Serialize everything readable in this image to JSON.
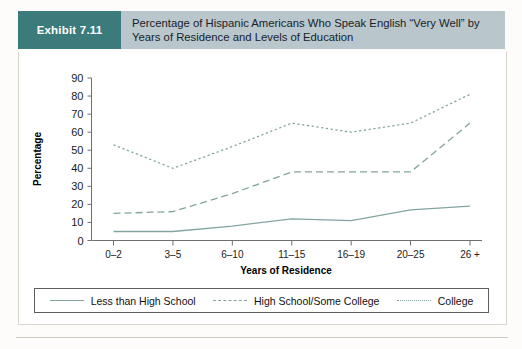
{
  "header": {
    "exhibit_label": "Exhibit 7.11",
    "title": "Percentage of Hispanic Americans Who Speak English “Very Well” by Years of Residence and Levels of Education"
  },
  "colors": {
    "tag_background": "#3c7b7b",
    "header_background": "#b9c6cb",
    "line": "#83a5a1",
    "axis": "#6f6f6f"
  },
  "chart_data": {
    "type": "line",
    "title": "Percentage of Hispanic Americans Who Speak English “Very Well” by Years of Residence and Levels of Education",
    "xlabel": "Years of Residence",
    "ylabel": "Percentage",
    "categories": [
      "0–2",
      "3–5",
      "6–10",
      "11–15",
      "16–19",
      "20–25",
      "26 +"
    ],
    "yticks": [
      0,
      10,
      20,
      30,
      40,
      50,
      60,
      70,
      80,
      90
    ],
    "ylim": [
      0,
      90
    ],
    "grid": false,
    "legend_position": "bottom",
    "series": [
      {
        "name": "Less than High School",
        "style": "solid",
        "values": [
          5,
          5,
          8,
          12,
          11,
          17,
          19
        ]
      },
      {
        "name": "High School/Some College",
        "style": "dashed",
        "values": [
          15,
          16,
          26,
          38,
          38,
          38,
          65
        ]
      },
      {
        "name": "College",
        "style": "dotted",
        "values": [
          53,
          40,
          52,
          65,
          60,
          65,
          81
        ]
      }
    ]
  },
  "legend": {
    "items": [
      {
        "label": "Less than High School",
        "style": "solid"
      },
      {
        "label": "High School/Some College",
        "style": "dashed"
      },
      {
        "label": "College",
        "style": "dotted"
      }
    ]
  }
}
